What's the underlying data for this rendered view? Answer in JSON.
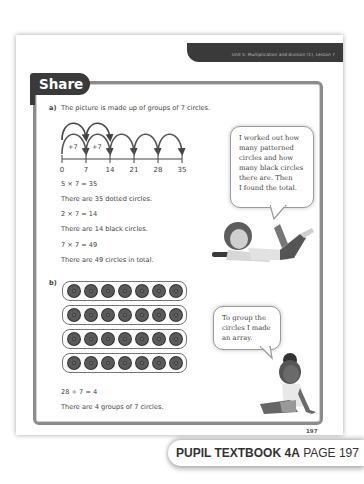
{
  "header": {
    "unit_banner": "Unit 5: Multiplication and division (1), Lesson 7",
    "section_tab": "Share"
  },
  "part_a": {
    "label": "a)",
    "intro": "The picture is made up of groups of 7 circles.",
    "number_line": {
      "ticks": [
        "0",
        "7",
        "14",
        "21",
        "28",
        "35"
      ],
      "jump_labels": [
        "+7",
        "+7"
      ]
    },
    "lines": [
      "5 × 7 = 35",
      "There are 35 dotted circles.",
      "2 × 7 = 14",
      "There are 14 black circles.",
      "7 × 7 = 49",
      "There are 49 circles in total."
    ],
    "speech_bubble": [
      "I worked out how",
      "many patterned",
      "circles and how",
      "many black circles",
      "there are. Then",
      "I found the total."
    ]
  },
  "part_b": {
    "label": "b)",
    "array": {
      "rows": 4,
      "cols": 7
    },
    "lines": [
      "28 ÷ 7 = 4",
      "There are 4 groups of 7 circles."
    ],
    "speech_bubble": [
      "To group the",
      "circles I made",
      "an array."
    ]
  },
  "footer": {
    "page_number": "197",
    "book_label": "PUPIL TEXTBOOK 4A",
    "page_label": "PAGE 197"
  },
  "colors": {
    "dark_banner": "#3a3a3a",
    "frame": "#8c8c8c",
    "text": "#444444"
  }
}
